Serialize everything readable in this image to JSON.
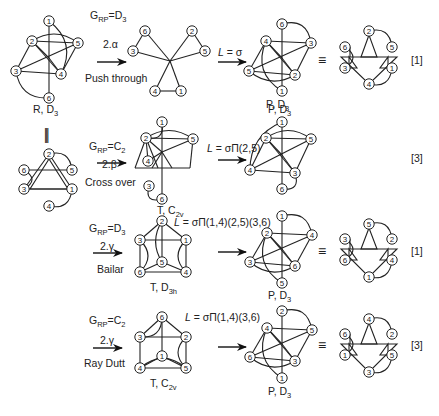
{
  "figure": {
    "equivalence_symbol": "≡",
    "vertical_equivalence_symbol": "|||",
    "footer_text_cut_off": ""
  },
  "rows": [
    {
      "id": "alpha",
      "group_label": "G_RP=D_3",
      "group_main": "G",
      "group_sub": "RP",
      "group_eq": "=D",
      "group_eq_sub": "3",
      "step": "2.α",
      "mechanism": "Push through",
      "labeling": "L = σ",
      "labeling_L": "L",
      "labeling_rest": " = σ",
      "multiplicity": "[1]",
      "intermediate_label": "",
      "product_label": "P, D3",
      "product_label_main": "P, D",
      "product_label_sub": "3"
    },
    {
      "id": "beta",
      "group_main": "G",
      "group_sub": "RP",
      "group_eq": "=C",
      "group_eq_sub": "2",
      "step": "2.β",
      "mechanism": "Cross over",
      "labeling_L": "L",
      "labeling_rest": " = σΠ(2,5)",
      "multiplicity": "[3]",
      "intermediate_label_main": "T, C",
      "intermediate_label_sub": "2v",
      "product_label_main": "P, D",
      "product_label_sub": "3"
    },
    {
      "id": "gamma-bailar",
      "group_main": "G",
      "group_sub": "RP",
      "group_eq": "=D",
      "group_eq_sub": "3",
      "step": "2.γ",
      "mechanism": "Bailar",
      "labeling_L": "L",
      "labeling_rest": " = σΠ(1,4)(2,5)(3,6)",
      "multiplicity": "[1]",
      "intermediate_label_main": "T, D",
      "intermediate_label_sub": "3h",
      "product_label_main": "P, D",
      "product_label_sub": "3"
    },
    {
      "id": "gamma-raydutt",
      "group_main": "G",
      "group_sub": "RP",
      "group_eq": "=C",
      "group_eq_sub": "2",
      "step": "2.γ",
      "mechanism": "Ray Dutt",
      "labeling_L": "L",
      "labeling_rest": " = σΠ(1,4)(3,6)",
      "multiplicity": "[3]",
      "intermediate_label_main": "T, C",
      "intermediate_label_sub": "2v",
      "product_label_main": "P, D",
      "product_label_sub": "3"
    }
  ],
  "reactant": {
    "label_main": "R, D",
    "label_sub": "3"
  },
  "graphs": [
    {
      "id": "reactant-3d",
      "nodes": [
        {
          "n": "1",
          "x": 49,
          "y": 21
        },
        {
          "n": "2",
          "x": 32,
          "y": 41
        },
        {
          "n": "5",
          "x": 78,
          "y": 43
        },
        {
          "n": "3",
          "x": 16,
          "y": 71
        },
        {
          "n": "4",
          "x": 61,
          "y": 74
        },
        {
          "n": "6",
          "x": 49,
          "y": 98
        }
      ],
      "center": {
        "x": 49,
        "y": 58
      },
      "lines": [
        [
          "2",
          "5"
        ],
        [
          "2",
          "3"
        ],
        [
          "2",
          "4"
        ],
        [
          "3",
          "4"
        ],
        [
          "3",
          "5"
        ],
        [
          "4",
          "5"
        ],
        [
          "1",
          "c"
        ],
        [
          "c",
          "6"
        ],
        [
          "2",
          "c"
        ],
        [
          "c",
          "4"
        ]
      ],
      "arcs": [
        [
          "1",
          "4",
          -14
        ],
        [
          "2",
          "5",
          -10
        ],
        [
          "3",
          "6",
          12
        ]
      ]
    },
    {
      "id": "reactant-planar",
      "nodes": [
        {
          "n": "2",
          "x": 49,
          "y": 154
        },
        {
          "n": "6",
          "x": 24,
          "y": 170
        },
        {
          "n": "5",
          "x": 72,
          "y": 170
        },
        {
          "n": "3",
          "x": 24,
          "y": 189
        },
        {
          "n": "1",
          "x": 72,
          "y": 189
        },
        {
          "n": "4",
          "x": 49,
          "y": 206
        }
      ],
      "lines": [
        [
          "6",
          "5"
        ],
        [
          "3",
          "1"
        ],
        [
          "2",
          "3"
        ],
        [
          "2",
          "1"
        ],
        [
          "2",
          "t1"
        ],
        [
          "t1",
          "t2"
        ]
      ],
      "extra_lines": [
        [
          37,
          170,
          61,
          170,
          37,
          170
        ],
        [
          33,
          189,
          65,
          189
        ]
      ],
      "triangles": [
        [
          [
            49,
            159
          ],
          [
            30,
            189
          ],
          [
            68,
            189
          ]
        ]
      ],
      "small_tris": [
        [
          [
            42,
            170
          ],
          [
            56,
            170
          ],
          [
            49,
            159
          ]
        ],
        [
          [
            42,
            189
          ],
          [
            56,
            189
          ],
          [
            49,
            201
          ]
        ]
      ],
      "arcs": [
        [
          "2",
          "5",
          -10
        ],
        [
          "6",
          "3",
          -10
        ],
        [
          "1",
          "4",
          -10
        ]
      ]
    },
    {
      "id": "push-through-intermediate",
      "nodes": [
        {
          "n": "6",
          "x": 145,
          "y": 31
        },
        {
          "n": "2",
          "x": 192,
          "y": 31
        },
        {
          "n": "3",
          "x": 133,
          "y": 51
        },
        {
          "n": "5",
          "x": 205,
          "y": 51
        },
        {
          "n": "4",
          "x": 155,
          "y": 91
        },
        {
          "n": "1",
          "x": 181,
          "y": 91
        }
      ],
      "center": {
        "x": 170,
        "y": 61
      },
      "lines": [
        [
          "6",
          "3"
        ],
        [
          "2",
          "5"
        ],
        [
          "4",
          "1"
        ],
        [
          "6",
          "c"
        ],
        [
          "3",
          "c"
        ],
        [
          "2",
          "c"
        ],
        [
          "5",
          "c"
        ],
        [
          "4",
          "c"
        ],
        [
          "1",
          "c"
        ]
      ],
      "arcs": []
    },
    {
      "id": "product-alpha",
      "nodes": [
        {
          "n": "6",
          "x": 282,
          "y": 24
        },
        {
          "n": "4",
          "x": 266,
          "y": 41
        },
        {
          "n": "3",
          "x": 311,
          "y": 43
        },
        {
          "n": "5",
          "x": 249,
          "y": 71
        },
        {
          "n": "2",
          "x": 295,
          "y": 75
        },
        {
          "n": "1",
          "x": 282,
          "y": 91
        }
      ],
      "center": {
        "x": 282,
        "y": 58
      },
      "lines": [
        [
          "4",
          "3"
        ],
        [
          "4",
          "5"
        ],
        [
          "4",
          "2"
        ],
        [
          "5",
          "2"
        ],
        [
          "5",
          "3"
        ],
        [
          "3",
          "2"
        ],
        [
          "6",
          "c"
        ],
        [
          "c",
          "1"
        ],
        [
          "4",
          "c"
        ],
        [
          "c",
          "2"
        ]
      ],
      "arcs": [
        [
          "6",
          "3",
          -12
        ],
        [
          "5",
          "2",
          10
        ],
        [
          "4",
          "1",
          14
        ]
      ]
    },
    {
      "id": "hex-alpha",
      "nodes": [
        {
          "n": "2",
          "x": 369,
          "y": 31
        },
        {
          "n": "6",
          "x": 345,
          "y": 47
        },
        {
          "n": "5",
          "x": 392,
          "y": 47
        },
        {
          "n": "3",
          "x": 345,
          "y": 68
        },
        {
          "n": "1",
          "x": 392,
          "y": 68
        },
        {
          "n": "4",
          "x": 369,
          "y": 84
        }
      ],
      "big_tri": [
        [
          341,
          57
        ],
        [
          397,
          57
        ],
        [
          369,
          84
        ]
      ],
      "arcs": [
        [
          "2",
          "5",
          -10
        ],
        [
          "6",
          "3",
          -10
        ],
        [
          "1",
          "4",
          -10
        ]
      ]
    },
    {
      "id": "cross-over-intermediate",
      "nodes": [
        {
          "n": "1",
          "x": 162,
          "y": 122
        },
        {
          "n": "2",
          "x": 146,
          "y": 138
        },
        {
          "n": "5",
          "x": 193,
          "y": 139
        },
        {
          "n": "4",
          "x": 148,
          "y": 161
        },
        {
          "n": "3",
          "x": 149,
          "y": 186
        },
        {
          "n": "6",
          "x": 162,
          "y": 199
        }
      ],
      "center": {
        "x": 162,
        "y": 152
      },
      "lines": [
        [
          "2",
          "5"
        ],
        [
          "2",
          "4"
        ],
        [
          "1",
          "6"
        ],
        [
          "c",
          "5"
        ]
      ],
      "raw": [
        [
          135,
          168,
          190,
          168
        ],
        [
          135,
          168,
          146,
          138
        ],
        [
          190,
          168,
          193,
          139
        ],
        [
          146,
          138,
          162,
          152
        ],
        [
          162,
          152,
          148,
          161
        ],
        [
          162,
          152,
          152,
          168
        ],
        [
          162,
          152,
          172,
          168
        ],
        [
          146,
          138,
          158,
          168
        ]
      ],
      "arcs": [
        [
          "1",
          "2",
          -10
        ],
        [
          "2",
          "5",
          -10
        ],
        [
          "3",
          "6",
          10
        ]
      ]
    },
    {
      "id": "product-beta",
      "nodes": [
        {
          "n": "1",
          "x": 282,
          "y": 122
        },
        {
          "n": "2",
          "x": 266,
          "y": 138
        },
        {
          "n": "5",
          "x": 311,
          "y": 139
        },
        {
          "n": "4",
          "x": 250,
          "y": 170
        },
        {
          "n": "3",
          "x": 295,
          "y": 173
        },
        {
          "n": "6",
          "x": 282,
          "y": 189
        }
      ],
      "center": {
        "x": 282,
        "y": 155
      },
      "lines": [
        [
          "2",
          "5"
        ],
        [
          "2",
          "4"
        ],
        [
          "2",
          "3"
        ],
        [
          "4",
          "3"
        ],
        [
          "4",
          "5"
        ],
        [
          "5",
          "3"
        ],
        [
          "1",
          "c"
        ],
        [
          "c",
          "6"
        ],
        [
          "2",
          "c"
        ],
        [
          "c",
          "3"
        ]
      ],
      "arcs": [
        [
          "1",
          "4",
          12
        ],
        [
          "2",
          "5",
          -10
        ],
        [
          "3",
          "6",
          -10
        ]
      ]
    },
    {
      "id": "bailar-intermediate",
      "nodes": [
        {
          "n": "2",
          "x": 162,
          "y": 221
        },
        {
          "n": "3",
          "x": 140,
          "y": 240
        },
        {
          "n": "1",
          "x": 186,
          "y": 240
        },
        {
          "n": "5",
          "x": 162,
          "y": 262
        },
        {
          "n": "6",
          "x": 140,
          "y": 272
        },
        {
          "n": "4",
          "x": 186,
          "y": 272
        }
      ],
      "lines": [
        [
          "2",
          "3"
        ],
        [
          "2",
          "1"
        ],
        [
          "3",
          "1"
        ],
        [
          "3",
          "6"
        ],
        [
          "1",
          "4"
        ],
        [
          "6",
          "4"
        ],
        [
          "6",
          "5"
        ],
        [
          "5",
          "4"
        ],
        [
          "2",
          "5"
        ]
      ],
      "arcs": [
        [
          "3",
          "6",
          -10
        ],
        [
          "1",
          "4",
          10
        ],
        [
          "2",
          "5",
          8
        ]
      ]
    },
    {
      "id": "product-gamma-bailar",
      "nodes": [
        {
          "n": "1",
          "x": 282,
          "y": 216
        },
        {
          "n": "2",
          "x": 267,
          "y": 233
        },
        {
          "n": "4",
          "x": 312,
          "y": 235
        },
        {
          "n": "3",
          "x": 250,
          "y": 262
        },
        {
          "n": "6",
          "x": 295,
          "y": 266
        },
        {
          "n": "5",
          "x": 282,
          "y": 283
        }
      ],
      "center": {
        "x": 282,
        "y": 249
      },
      "lines": [
        [
          "2",
          "4"
        ],
        [
          "2",
          "3"
        ],
        [
          "2",
          "6"
        ],
        [
          "3",
          "6"
        ],
        [
          "3",
          "4"
        ],
        [
          "4",
          "6"
        ],
        [
          "1",
          "c"
        ],
        [
          "c",
          "5"
        ],
        [
          "2",
          "c"
        ],
        [
          "c",
          "6"
        ]
      ],
      "arcs": [
        [
          "1",
          "4",
          -12
        ],
        [
          "3",
          "6",
          10
        ],
        [
          "2",
          "5",
          14
        ]
      ]
    },
    {
      "id": "hex-gamma-bailar",
      "nodes": [
        {
          "n": "5",
          "x": 369,
          "y": 224
        },
        {
          "n": "3",
          "x": 345,
          "y": 239
        },
        {
          "n": "2",
          "x": 392,
          "y": 239
        },
        {
          "n": "6",
          "x": 345,
          "y": 260
        },
        {
          "n": "4",
          "x": 392,
          "y": 260
        },
        {
          "n": "1",
          "x": 369,
          "y": 277
        }
      ],
      "big_tri": [
        [
          341,
          249
        ],
        [
          397,
          249
        ],
        [
          369,
          277
        ]
      ],
      "arcs": [
        [
          "5",
          "2",
          -10
        ],
        [
          "3",
          "6",
          -10
        ],
        [
          "4",
          "1",
          -10
        ]
      ]
    },
    {
      "id": "raydutt-intermediate",
      "nodes": [
        {
          "n": "6",
          "x": 162,
          "y": 317
        },
        {
          "n": "3",
          "x": 140,
          "y": 337
        },
        {
          "n": "2",
          "x": 186,
          "y": 337
        },
        {
          "n": "1",
          "x": 162,
          "y": 356
        },
        {
          "n": "4",
          "x": 140,
          "y": 368
        },
        {
          "n": "5",
          "x": 186,
          "y": 368
        }
      ],
      "lines": [
        [
          "6",
          "3"
        ],
        [
          "6",
          "2"
        ],
        [
          "3",
          "2"
        ],
        [
          "3",
          "4"
        ],
        [
          "2",
          "5"
        ],
        [
          "4",
          "5"
        ],
        [
          "4",
          "1"
        ],
        [
          "1",
          "5"
        ],
        [
          "6",
          "1"
        ]
      ],
      "arcs": [
        [
          "6",
          "3",
          -10
        ],
        [
          "2",
          "5",
          10
        ],
        [
          "4",
          "5",
          -12
        ]
      ]
    },
    {
      "id": "product-gamma-raydutt",
      "nodes": [
        {
          "n": "2",
          "x": 282,
          "y": 311
        },
        {
          "n": "4",
          "x": 267,
          "y": 328
        },
        {
          "n": "5",
          "x": 312,
          "y": 330
        },
        {
          "n": "6",
          "x": 250,
          "y": 357
        },
        {
          "n": "3",
          "x": 295,
          "y": 361
        },
        {
          "n": "1",
          "x": 282,
          "y": 378
        }
      ],
      "center": {
        "x": 282,
        "y": 344
      },
      "lines": [
        [
          "4",
          "5"
        ],
        [
          "4",
          "6"
        ],
        [
          "4",
          "3"
        ],
        [
          "6",
          "3"
        ],
        [
          "6",
          "5"
        ],
        [
          "5",
          "3"
        ],
        [
          "2",
          "c"
        ],
        [
          "c",
          "1"
        ],
        [
          "4",
          "c"
        ],
        [
          "c",
          "3"
        ]
      ],
      "arcs": [
        [
          "2",
          "5",
          -12
        ],
        [
          "6",
          "3",
          10
        ],
        [
          "4",
          "1",
          14
        ]
      ]
    },
    {
      "id": "hex-gamma-raydutt",
      "nodes": [
        {
          "n": "4",
          "x": 369,
          "y": 319
        },
        {
          "n": "6",
          "x": 345,
          "y": 334
        },
        {
          "n": "2",
          "x": 392,
          "y": 334
        },
        {
          "n": "1",
          "x": 345,
          "y": 355
        },
        {
          "n": "5",
          "x": 392,
          "y": 355
        },
        {
          "n": "3",
          "x": 369,
          "y": 372
        }
      ],
      "big_tri": [
        [
          341,
          344
        ],
        [
          397,
          344
        ],
        [
          369,
          372
        ]
      ],
      "arcs": [
        [
          "4",
          "2",
          -10
        ],
        [
          "6",
          "1",
          -10
        ],
        [
          "5",
          "3",
          -10
        ]
      ]
    }
  ]
}
